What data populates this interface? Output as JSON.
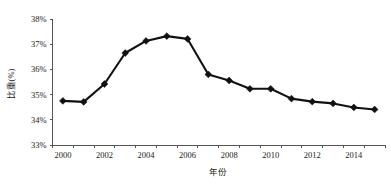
{
  "chart_data": {
    "type": "line",
    "title": "",
    "xlabel": "年份",
    "ylabel": "比重(%)",
    "categories": [
      2000,
      2001,
      2002,
      2003,
      2004,
      2005,
      2006,
      2007,
      2008,
      2009,
      2010,
      2011,
      2012,
      2013,
      2014,
      2015
    ],
    "values": [
      34.75,
      34.71,
      35.42,
      36.65,
      37.13,
      37.32,
      37.21,
      35.8,
      35.56,
      35.23,
      35.23,
      34.84,
      34.72,
      34.65,
      34.49,
      34.41
    ],
    "x": [
      2000,
      2001,
      2002,
      2003,
      2004,
      2005,
      2006,
      2007,
      2008,
      2009,
      2010,
      2011,
      2012,
      2013,
      2014,
      2015
    ],
    "xlim": [
      1999.5,
      2015.5
    ],
    "ylim": [
      33,
      38
    ],
    "ytick_labels": [
      "38%",
      "37%",
      "36%",
      "35%",
      "34%",
      "33%"
    ],
    "ytick_values": [
      38,
      37,
      36,
      35,
      34,
      33
    ],
    "xtick_labels": [
      "2000",
      "2002",
      "2004",
      "2006",
      "2008",
      "2010",
      "2012",
      "2014"
    ],
    "xtick_values": [
      2000,
      2002,
      2004,
      2006,
      2008,
      2010,
      2012,
      2014
    ],
    "grid": false,
    "legend": null,
    "legend_position": "none",
    "series": [
      {
        "name": "比重(%)",
        "color": "#111111",
        "marker": "diamond",
        "values": [
          34.75,
          34.71,
          35.42,
          36.65,
          37.13,
          37.32,
          37.21,
          35.8,
          35.56,
          35.23,
          35.23,
          34.84,
          34.72,
          34.65,
          34.49,
          34.41
        ]
      }
    ]
  },
  "colors": {
    "series": "#111111",
    "axis": "#555555",
    "text": "#1a1a1a",
    "background": "#ffffff"
  }
}
